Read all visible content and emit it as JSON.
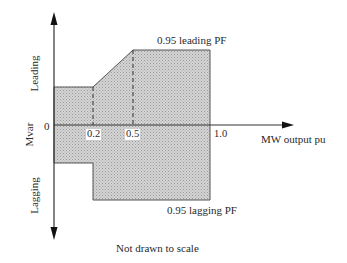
{
  "diagram": {
    "y_axis": {
      "label": "Mvar",
      "upper_label": "Leading",
      "lower_label": "Lagging",
      "origin_label": "0"
    },
    "x_axis": {
      "label": "MW output pu",
      "ticks": [
        "0.2",
        "0.5",
        "1.0"
      ]
    },
    "annotations": {
      "top": "0.95 leading PF",
      "bottom": "0.95 lagging PF",
      "footnote": "Not drawn to scale"
    },
    "colors": {
      "region_fill": "#c8c8c8",
      "stroke": "#444444"
    }
  }
}
